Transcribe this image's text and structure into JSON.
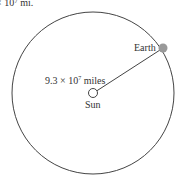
{
  "diagram": {
    "top_text_fragment": "× 10⁷ mi.",
    "orbit": {
      "cx": 93,
      "cy": 93,
      "r": 81,
      "stroke": "#444444"
    },
    "sun": {
      "label": "Sun",
      "cx": 93,
      "cy": 93,
      "r": 4.5,
      "fill": "#ffffff",
      "stroke": "#444444"
    },
    "earth": {
      "label": "Earth",
      "cx": 163,
      "cy": 48,
      "r": 4.5,
      "fill": "#999999"
    },
    "radius_label": {
      "mantissa": "9.3 × 10",
      "exponent": "7",
      "unit": " miles"
    }
  }
}
